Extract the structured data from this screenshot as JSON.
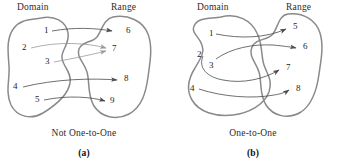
{
  "figure": {
    "panels": [
      {
        "id": "a",
        "sub_caption": "(a)",
        "caption": "Not One-to-One",
        "domain_label": "Domain",
        "range_label": "Range",
        "domain_items": [
          "1",
          "2",
          "3",
          "4",
          "5"
        ],
        "range_items": [
          "6",
          "7",
          "8",
          "9"
        ],
        "mappings": [
          {
            "from": "1",
            "to": "6"
          },
          {
            "from": "2",
            "to": "7"
          },
          {
            "from": "3",
            "to": "7"
          },
          {
            "from": "4",
            "to": "8"
          },
          {
            "from": "5",
            "to": "9"
          }
        ]
      },
      {
        "id": "b",
        "sub_caption": "(b)",
        "caption": "One-to-One",
        "domain_label": "Domain",
        "range_label": "Range",
        "domain_items": [
          "1",
          "2",
          "3",
          "4"
        ],
        "range_items": [
          "5",
          "6",
          "7",
          "8"
        ],
        "mappings": [
          {
            "from": "1",
            "to": "5"
          },
          {
            "from": "3",
            "to": "6"
          },
          {
            "from": "2",
            "to": "7"
          },
          {
            "from": "4",
            "to": "8"
          }
        ]
      }
    ],
    "colors": {
      "blob_stroke": "#8a8a8a",
      "arrow_stroke": "#4a4a4a",
      "arrow_faint": "#9a9a9a",
      "text": "#1d1d1d",
      "background": "#ffffff"
    }
  }
}
